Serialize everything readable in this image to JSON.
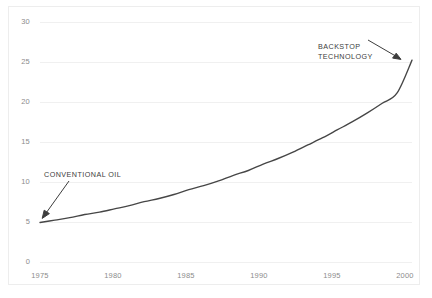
{
  "chart_data": {
    "type": "line",
    "title": "",
    "subtitle": "",
    "xlabel": "",
    "ylabel": "",
    "xlim": [
      1975,
      2000
    ],
    "ylim": [
      0,
      30
    ],
    "grid": true,
    "legend": "none",
    "x_ticks": [
      "1975",
      "1980",
      "1985",
      "1990",
      "1995",
      "2000"
    ],
    "y_ticks": [
      "0",
      "5",
      "10",
      "15",
      "20",
      "25",
      "30"
    ],
    "series": [
      {
        "name": "Resource cost path",
        "color": "#464646",
        "x": [
          1975,
          1976,
          1977,
          1978,
          1979,
          1980,
          1981,
          1982,
          1983,
          1984,
          1985,
          1986,
          1987,
          1988,
          1989,
          1990,
          1991,
          1992,
          1993,
          1994,
          1995,
          1996,
          1997,
          1998,
          1999,
          2000
        ],
        "values": [
          5.0,
          5.3,
          5.6,
          6.0,
          6.3,
          6.7,
          7.1,
          7.6,
          8.0,
          8.5,
          9.1,
          9.6,
          10.2,
          10.9,
          11.5,
          12.3,
          13.0,
          13.8,
          14.7,
          15.6,
          16.6,
          17.6,
          18.7,
          19.9,
          21.2,
          25.3
        ]
      }
    ],
    "annotations": [
      {
        "id": "backstop",
        "text": "BACKSTOP\nTECHNOLOGY",
        "arrow_from": [
          368,
          40
        ],
        "arrow_to": [
          401,
          59
        ]
      },
      {
        "id": "conventional",
        "text": "CONVENTIONAL OIL",
        "arrow_from": [
          69,
          181
        ],
        "arrow_to": [
          42,
          218
        ]
      }
    ]
  },
  "axis": {
    "y_labels": [
      {
        "text": "30",
        "top": 18
      },
      {
        "text": "25",
        "top": 58
      },
      {
        "text": "20",
        "top": 98
      },
      {
        "text": "15",
        "top": 138
      },
      {
        "text": "10",
        "top": 178
      },
      {
        "text": "5",
        "top": 218
      },
      {
        "text": "0",
        "top": 258
      }
    ],
    "x_labels": [
      {
        "text": "1975",
        "left": 20
      },
      {
        "text": "1980",
        "left": 93
      },
      {
        "text": "1985",
        "left": 166
      },
      {
        "text": "1990",
        "left": 239
      },
      {
        "text": "1995",
        "left": 312
      },
      {
        "text": "2000",
        "left": 385
      }
    ]
  },
  "annotations": {
    "backstop": "BACKSTOP\nTECHNOLOGY",
    "conventional": "CONVENTIONAL OIL"
  },
  "colors": {
    "curve": "#464646",
    "gridline": "#f0f0f0",
    "tick_text": "#8c8c8c",
    "annotation_text": "#3d3d3d",
    "frame": "#ededed",
    "background": "#ffffff"
  }
}
